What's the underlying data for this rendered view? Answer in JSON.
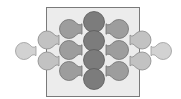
{
  "diagram": {
    "type": "node-funnel-diagram",
    "colors": {
      "background": "#ffffff",
      "box_fill": "#ececec",
      "box_stroke": "#7a7a7a",
      "center_fill": "#7c7c7c",
      "center_stroke": "#5a5a5a",
      "mid_fill": "#9d9d9d",
      "mid_stroke": "#707070",
      "outer_fill": "#c2c2c2",
      "outer_stroke": "#8a8a8a",
      "far_fill": "#d2d2d2",
      "far_stroke": "#999999"
    },
    "box": {
      "x": 46,
      "y": 7,
      "width": 93,
      "height": 89
    },
    "center_circles": [
      {
        "cx": 94,
        "cy": 22,
        "r": 10.5
      },
      {
        "cx": 94,
        "cy": 41,
        "r": 10.5
      },
      {
        "cx": 94,
        "cy": 60,
        "r": 10.5
      },
      {
        "cx": 94,
        "cy": 79,
        "r": 10.5
      }
    ],
    "funnels": [
      {
        "group": "mid",
        "cx": 69,
        "cy": 29,
        "r": 9.5,
        "dir": 1,
        "tip": 82
      },
      {
        "group": "mid",
        "cx": 69,
        "cy": 50,
        "r": 9.5,
        "dir": 1,
        "tip": 82
      },
      {
        "group": "mid",
        "cx": 69,
        "cy": 71,
        "r": 9.5,
        "dir": 1,
        "tip": 82
      },
      {
        "group": "mid",
        "cx": 119,
        "cy": 29,
        "r": 9.5,
        "dir": -1,
        "tip": 106
      },
      {
        "group": "mid",
        "cx": 119,
        "cy": 50,
        "r": 9.5,
        "dir": -1,
        "tip": 106
      },
      {
        "group": "mid",
        "cx": 119,
        "cy": 71,
        "r": 9.5,
        "dir": -1,
        "tip": 106
      },
      {
        "group": "outer",
        "cx": 47,
        "cy": 40,
        "r": 9,
        "dir": 1,
        "tip": 59
      },
      {
        "group": "outer",
        "cx": 47,
        "cy": 61,
        "r": 9,
        "dir": 1,
        "tip": 59
      },
      {
        "group": "outer",
        "cx": 142,
        "cy": 40,
        "r": 9,
        "dir": -1,
        "tip": 130
      },
      {
        "group": "outer",
        "cx": 142,
        "cy": 61,
        "r": 9,
        "dir": -1,
        "tip": 130
      },
      {
        "group": "far",
        "cx": 24,
        "cy": 51,
        "r": 8.5,
        "dir": 1,
        "tip": 36
      },
      {
        "group": "far",
        "cx": 163,
        "cy": 51,
        "r": 8.5,
        "dir": -1,
        "tip": 151
      }
    ]
  }
}
